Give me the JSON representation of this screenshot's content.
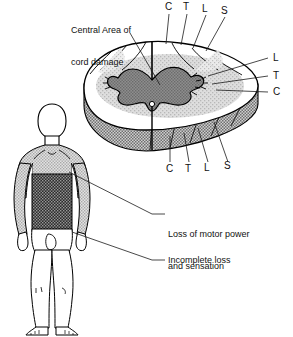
{
  "figure": {
    "title_caption": "Central Area of\ncord damage",
    "title_line1": "Central Area of",
    "title_line2": "cord damage",
    "captions": [
      {
        "id": "loss-motor",
        "line1": "Loss of motor power",
        "line2": "and sensation"
      },
      {
        "id": "incomplete",
        "line1": "Incomplete loss",
        "line2": ""
      }
    ],
    "segment_labels_top": [
      "C",
      "T",
      "L",
      "S"
    ],
    "segment_labels_right": [
      "L",
      "T",
      "C"
    ],
    "segment_labels_bottom": [
      "C",
      "T",
      "L",
      "S"
    ],
    "body_regions": {
      "severe_label": "Loss of motor power and sensation",
      "partial_label": "Incomplete loss"
    },
    "colors": {
      "outline": "#000000",
      "white_matter": "#ffffff",
      "gray_matter": "#7d7d7d",
      "damage_halo": "#c9c9c9",
      "cord_side_wall": "#8d8d8d",
      "body_severe": "#2b2b2b",
      "body_partial": "#c4c4c4",
      "body_skin": "#ffffff",
      "leader_line": "#333333",
      "background": "#ffffff"
    }
  }
}
